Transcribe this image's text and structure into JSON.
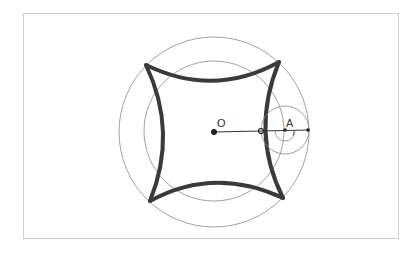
{
  "diagram": {
    "labels": {
      "center": "O",
      "point_a": "A"
    },
    "colors": {
      "curve": "#3a3a3a",
      "circle": "#8a8a8a",
      "frame": "#cfcfcf",
      "segment": "#333333"
    },
    "geometry": {
      "center": [
        214,
        131
      ],
      "outer_circle_radius": 95,
      "inner_circle_radius": 70,
      "small_circle_center": [
        285,
        130
      ],
      "small_circle_radius": 24,
      "point_on_curve": [
        261,
        130
      ],
      "segment_end": [
        308,
        130
      ]
    }
  }
}
